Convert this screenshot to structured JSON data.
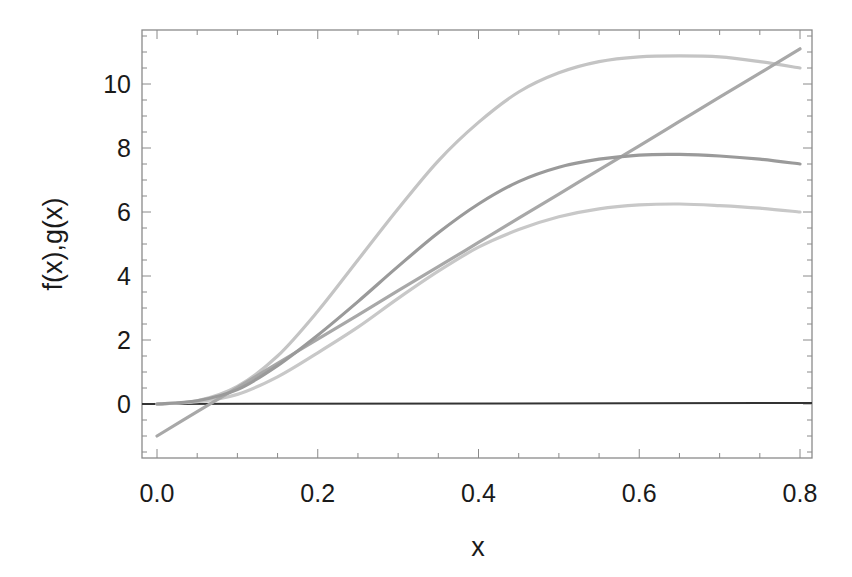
{
  "chart_data": {
    "type": "line",
    "title": "",
    "xlabel": "x",
    "ylabel": "f(x),g(x)",
    "xlim": [
      -0.02,
      0.81
    ],
    "ylim": [
      -1.7,
      11.7
    ],
    "grid": false,
    "legend": null,
    "x_ticks": [
      "0.0",
      "0.2",
      "0.4",
      "0.6",
      "0.8"
    ],
    "y_ticks": [
      "0",
      "2",
      "4",
      "6",
      "8",
      "10"
    ],
    "x": [
      0.0,
      0.05,
      0.1,
      0.15,
      0.2,
      0.25,
      0.3,
      0.35,
      0.4,
      0.45,
      0.5,
      0.55,
      0.6,
      0.65,
      0.7,
      0.75,
      0.8
    ],
    "series": [
      {
        "name": "f1 (upper curve)",
        "color": "#c4c4c4",
        "values": [
          0.0,
          0.1,
          0.55,
          1.5,
          2.9,
          4.5,
          6.1,
          7.6,
          8.8,
          9.75,
          10.35,
          10.7,
          10.85,
          10.88,
          10.85,
          10.7,
          10.5
        ]
      },
      {
        "name": "f2 (middle curve)",
        "color": "#9a9a9a",
        "values": [
          0.0,
          0.1,
          0.45,
          1.2,
          2.15,
          3.2,
          4.3,
          5.35,
          6.25,
          6.95,
          7.4,
          7.65,
          7.78,
          7.8,
          7.75,
          7.65,
          7.5
        ]
      },
      {
        "name": "f3 (lower curve)",
        "color": "#c8c8c8",
        "values": [
          0.0,
          0.07,
          0.3,
          0.85,
          1.6,
          2.4,
          3.3,
          4.15,
          4.9,
          5.45,
          5.85,
          6.1,
          6.22,
          6.25,
          6.2,
          6.12,
          6.0
        ]
      },
      {
        "name": "g(x) (line)",
        "color": "#a8a8a8",
        "values": [
          -1.0,
          -0.24,
          0.51,
          1.27,
          2.03,
          2.78,
          3.54,
          4.29,
          5.05,
          5.81,
          6.56,
          7.32,
          8.07,
          8.83,
          9.59,
          10.34,
          11.1
        ]
      },
      {
        "name": "zero",
        "color": "#333333",
        "values": [
          0.0,
          0.0,
          0.0,
          0.0,
          0.0,
          0.0,
          0.0,
          0.0,
          0.0,
          0.0,
          0.0,
          0.0,
          0.0,
          0.0,
          0.0,
          0.0,
          0.0
        ]
      }
    ]
  }
}
